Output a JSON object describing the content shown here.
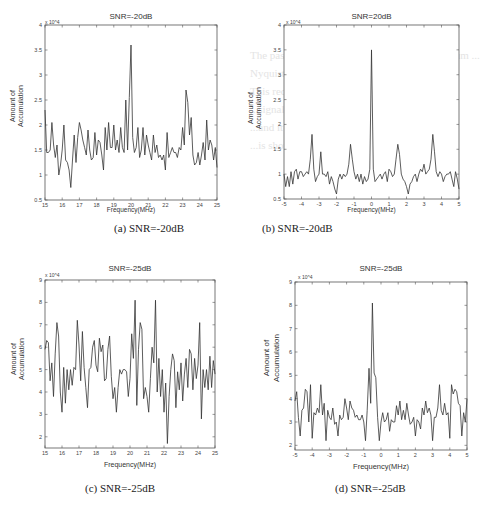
{
  "figure": {
    "captions": [
      "(a) SNR=-20dB",
      "(b) SNR=-20dB",
      "(c) SNR=-25dB",
      "(d) SNR=-25dB"
    ]
  },
  "chart_data": [
    {
      "type": "line",
      "panel": "a",
      "title": "SNR=-20dB",
      "caption": "(a) SNR=-20dB",
      "xlabel": "Frequency(MHz)",
      "ylabel": "Amount of Accumulation",
      "y_exponent": "x 10^4",
      "xlim": [
        15,
        25
      ],
      "ylim": [
        0.5,
        4
      ],
      "xticks": [
        15,
        16,
        17,
        18,
        19,
        20,
        21,
        22,
        23,
        24,
        25
      ],
      "yticks": [
        0.5,
        1,
        1.5,
        2,
        2.5,
        3,
        3.5,
        4
      ],
      "grid": false,
      "x": [
        15,
        15.1,
        15.2,
        15.3,
        15.4,
        15.5,
        15.6,
        15.7,
        15.8,
        15.9,
        16,
        16.1,
        16.2,
        16.3,
        16.4,
        16.5,
        16.6,
        16.7,
        16.8,
        16.9,
        17,
        17.1,
        17.2,
        17.3,
        17.4,
        17.5,
        17.6,
        17.7,
        17.8,
        17.9,
        18,
        18.1,
        18.2,
        18.3,
        18.4,
        18.5,
        18.6,
        18.7,
        18.8,
        18.9,
        19,
        19.1,
        19.2,
        19.3,
        19.4,
        19.5,
        19.6,
        19.7,
        19.8,
        19.9,
        20,
        20.1,
        20.2,
        20.3,
        20.4,
        20.5,
        20.6,
        20.7,
        20.8,
        20.9,
        21,
        21.1,
        21.2,
        21.3,
        21.4,
        21.5,
        21.6,
        21.7,
        21.8,
        21.9,
        22,
        22.1,
        22.2,
        22.3,
        22.4,
        22.5,
        22.6,
        22.7,
        22.8,
        22.9,
        23,
        23.1,
        23.2,
        23.3,
        23.4,
        23.5,
        23.6,
        23.7,
        23.8,
        23.9,
        24,
        24.1,
        24.2,
        24.3,
        24.4,
        24.5,
        24.6,
        24.7,
        24.8,
        24.9,
        25
      ],
      "values": [
        2.3,
        1.45,
        1.45,
        1.5,
        2.05,
        1.6,
        1.35,
        1.6,
        1.0,
        1.2,
        1.5,
        2.0,
        1.3,
        1.25,
        1.1,
        0.75,
        1.3,
        1.8,
        1.25,
        1.75,
        2.05,
        1.9,
        1.7,
        1.55,
        1.4,
        1.9,
        1.5,
        1.3,
        1.35,
        1.85,
        1.4,
        1.7,
        1.65,
        1.4,
        1.1,
        1.95,
        1.5,
        2.05,
        1.55,
        1.55,
        2.0,
        1.5,
        1.7,
        1.45,
        1.95,
        1.55,
        1.45,
        2.5,
        1.5,
        2.55,
        3.6,
        1.75,
        1.45,
        1.55,
        1.95,
        1.35,
        1.5,
        1.95,
        1.4,
        1.8,
        1.6,
        1.45,
        1.3,
        1.8,
        1.45,
        1.6,
        1.35,
        1.4,
        1.3,
        1.4,
        1.1,
        1.85,
        1.35,
        1.45,
        1.55,
        1.45,
        1.45,
        1.35,
        1.55,
        1.5,
        1.95,
        1.6,
        2.7,
        2.45,
        1.8,
        2.15,
        1.4,
        1.2,
        1.25,
        1.45,
        1.2,
        1.4,
        1.65,
        1.3,
        2.1,
        1.5,
        1.7,
        1.6,
        1.3,
        1.55,
        1.15
      ]
    },
    {
      "type": "line",
      "panel": "b",
      "title": "SNR=20dB",
      "caption": "(b) SNR=-20dB",
      "xlabel": "Frequency(MHz)",
      "ylabel": "Amount of Accumulation",
      "y_exponent": "x 10^4",
      "xlim": [
        -5,
        5
      ],
      "ylim": [
        0.5,
        4
      ],
      "xticks": [
        -5,
        -4,
        -3,
        -2,
        -1,
        0,
        1,
        2,
        3,
        4,
        5
      ],
      "yticks": [
        0.5,
        1,
        1.5,
        2,
        2.5,
        3,
        3.5,
        4
      ],
      "grid": false,
      "x": [
        -5,
        -4.9,
        -4.8,
        -4.7,
        -4.6,
        -4.5,
        -4.4,
        -4.3,
        -4.2,
        -4.1,
        -4,
        -3.9,
        -3.8,
        -3.7,
        -3.6,
        -3.5,
        -3.4,
        -3.3,
        -3.2,
        -3.1,
        -3,
        -2.9,
        -2.8,
        -2.7,
        -2.6,
        -2.5,
        -2.4,
        -2.3,
        -2.2,
        -2.1,
        -2,
        -1.9,
        -1.8,
        -1.7,
        -1.6,
        -1.5,
        -1.4,
        -1.3,
        -1.2,
        -1.1,
        -1,
        -0.9,
        -0.8,
        -0.7,
        -0.6,
        -0.5,
        -0.4,
        -0.3,
        -0.2,
        -0.1,
        0,
        0.1,
        0.2,
        0.3,
        0.4,
        0.5,
        0.6,
        0.7,
        0.8,
        0.9,
        1,
        1.1,
        1.2,
        1.3,
        1.4,
        1.5,
        1.6,
        1.7,
        1.8,
        1.9,
        2,
        2.1,
        2.2,
        2.3,
        2.4,
        2.5,
        2.6,
        2.7,
        2.8,
        2.9,
        3,
        3.1,
        3.2,
        3.3,
        3.4,
        3.5,
        3.6,
        3.7,
        3.8,
        3.9,
        4,
        4.1,
        4.2,
        4.3,
        4.4,
        4.5,
        4.6,
        4.7,
        4.8,
        4.9,
        5
      ],
      "values": [
        1.0,
        0.75,
        0.95,
        0.75,
        1.05,
        0.8,
        1.05,
        1.1,
        0.9,
        1.05,
        1.05,
        0.95,
        1.0,
        1.05,
        1.0,
        1.3,
        1.8,
        1.1,
        0.85,
        0.95,
        1.0,
        1.45,
        1.0,
        1.0,
        0.95,
        1.05,
        0.8,
        0.95,
        0.85,
        0.7,
        0.6,
        0.9,
        1.0,
        0.9,
        1.0,
        0.95,
        1.0,
        1.2,
        1.6,
        1.3,
        1.05,
        0.9,
        1.0,
        0.85,
        1.0,
        0.8,
        0.95,
        0.85,
        0.9,
        1.1,
        3.5,
        1.1,
        0.85,
        0.9,
        0.95,
        1.0,
        0.9,
        1.0,
        1.05,
        0.85,
        1.1,
        1.05,
        0.95,
        1.0,
        1.3,
        1.6,
        1.4,
        1.0,
        0.9,
        0.85,
        0.75,
        0.6,
        0.8,
        0.85,
        0.95,
        1.0,
        0.85,
        1.0,
        1.1,
        1.05,
        1.2,
        1.0,
        1.05,
        1.1,
        1.3,
        1.8,
        1.45,
        1.05,
        0.95,
        1.05,
        1.0,
        0.85,
        0.95,
        1.0,
        1.0,
        1.05,
        0.9,
        0.75,
        1.05,
        0.9,
        0.7
      ]
    },
    {
      "type": "line",
      "panel": "c",
      "title": "SNR=-25dB",
      "caption": "(c) SNR=-25dB",
      "xlabel": "Frequency(MHz)",
      "ylabel": "Amount of Accumulation",
      "y_exponent": "x 10^4",
      "xlim": [
        15,
        25
      ],
      "ylim": [
        1.5,
        9
      ],
      "xticks": [
        15,
        16,
        17,
        18,
        19,
        20,
        21,
        22,
        23,
        24,
        25
      ],
      "yticks": [
        2,
        3,
        4,
        5,
        6,
        7,
        8,
        9
      ],
      "grid": false,
      "x": [
        15,
        15.1,
        15.2,
        15.3,
        15.4,
        15.5,
        15.6,
        15.7,
        15.8,
        15.9,
        16,
        16.1,
        16.2,
        16.3,
        16.4,
        16.5,
        16.6,
        16.7,
        16.8,
        16.9,
        17,
        17.1,
        17.2,
        17.3,
        17.4,
        17.5,
        17.6,
        17.7,
        17.8,
        17.9,
        18,
        18.1,
        18.2,
        18.3,
        18.4,
        18.5,
        18.6,
        18.7,
        18.8,
        18.9,
        19,
        19.1,
        19.2,
        19.3,
        19.4,
        19.5,
        19.6,
        19.7,
        19.8,
        19.9,
        20,
        20.1,
        20.2,
        20.3,
        20.4,
        20.5,
        20.6,
        20.7,
        20.8,
        20.9,
        21,
        21.1,
        21.2,
        21.3,
        21.4,
        21.5,
        21.6,
        21.7,
        21.8,
        21.9,
        22,
        22.1,
        22.2,
        22.3,
        22.4,
        22.5,
        22.6,
        22.7,
        22.8,
        22.9,
        23,
        23.1,
        23.2,
        23.3,
        23.4,
        23.5,
        23.6,
        23.7,
        23.8,
        23.9,
        24,
        24.1,
        24.2,
        24.3,
        24.4,
        24.5,
        24.6,
        24.7,
        24.8,
        24.9,
        25
      ],
      "values": [
        5.9,
        6.3,
        6.2,
        4.5,
        5.3,
        3.8,
        5.7,
        7.1,
        6.5,
        4.0,
        3.1,
        5.1,
        3.5,
        5.0,
        4.1,
        5.0,
        4.3,
        5.1,
        5.0,
        7.2,
        6.1,
        4.5,
        6.7,
        5.1,
        4.2,
        3.3,
        5.0,
        5.1,
        6.0,
        6.3,
        5.2,
        4.9,
        6.4,
        5.8,
        6.1,
        4.5,
        4.6,
        5.9,
        6.5,
        4.7,
        3.7,
        4.2,
        3.1,
        4.2,
        5.0,
        4.8,
        5.0,
        5.0,
        4.9,
        3.8,
        4.6,
        6.6,
        5.5,
        8.1,
        3.4,
        5.9,
        7.1,
        6.8,
        3.7,
        4.2,
        3.8,
        3.1,
        4.6,
        6.0,
        5.3,
        8.1,
        4.0,
        5.5,
        3.8,
        5.0,
        3.1,
        4.4,
        1.7,
        3.8,
        5.0,
        5.7,
        5.4,
        3.3,
        4.9,
        4.1,
        5.3,
        3.6,
        4.8,
        5.5,
        4.2,
        5.9,
        5.7,
        4.1,
        5.5,
        4.6,
        5.2,
        7.1,
        2.8,
        5.0,
        4.2,
        5.0,
        4.1,
        5.6,
        4.2,
        5.4,
        4.8
      ]
    },
    {
      "type": "line",
      "panel": "d",
      "title": "SNR=-25dB",
      "caption": "(d) SNR=-25dB",
      "xlabel": "Frequency(MHz)",
      "ylabel": "Amount of Accumulation",
      "y_exponent": "x 10^4",
      "xlim": [
        -5,
        5
      ],
      "ylim": [
        1.8,
        9
      ],
      "xticks": [
        -5,
        -4,
        -3,
        -2,
        -1,
        0,
        1,
        2,
        3,
        4,
        5
      ],
      "yticks": [
        2,
        3,
        4,
        5,
        6,
        7,
        8,
        9
      ],
      "grid": false,
      "x": [
        -5,
        -4.9,
        -4.8,
        -4.7,
        -4.6,
        -4.5,
        -4.4,
        -4.3,
        -4.2,
        -4.1,
        -4,
        -3.9,
        -3.8,
        -3.7,
        -3.6,
        -3.5,
        -3.4,
        -3.3,
        -3.2,
        -3.1,
        -3,
        -2.9,
        -2.8,
        -2.7,
        -2.6,
        -2.5,
        -2.4,
        -2.3,
        -2.2,
        -2.1,
        -2,
        -1.9,
        -1.8,
        -1.7,
        -1.6,
        -1.5,
        -1.4,
        -1.3,
        -1.2,
        -1.1,
        -1,
        -0.9,
        -0.8,
        -0.7,
        -0.6,
        -0.5,
        -0.4,
        -0.3,
        -0.2,
        -0.1,
        0,
        0.1,
        0.2,
        0.3,
        0.4,
        0.5,
        0.6,
        0.7,
        0.8,
        0.9,
        1,
        1.1,
        1.2,
        1.3,
        1.4,
        1.5,
        1.6,
        1.7,
        1.8,
        1.9,
        2,
        2.1,
        2.2,
        2.3,
        2.4,
        2.5,
        2.6,
        2.7,
        2.8,
        2.9,
        3,
        3.1,
        3.2,
        3.3,
        3.4,
        3.5,
        3.6,
        3.7,
        3.8,
        3.9,
        4,
        4.1,
        4.2,
        4.3,
        4.4,
        4.5,
        4.6,
        4.7,
        4.8,
        4.9,
        5
      ],
      "values": [
        3.9,
        4.3,
        3.2,
        2.4,
        3.5,
        3.6,
        4.4,
        4.3,
        3.0,
        4.6,
        2.3,
        3.4,
        3.3,
        3.6,
        3.4,
        4.6,
        3.3,
        3.8,
        2.2,
        3.5,
        3.2,
        3.1,
        3.6,
        2.9,
        3.0,
        2.4,
        3.3,
        3.1,
        3.2,
        4.0,
        3.6,
        3.1,
        3.9,
        3.6,
        3.5,
        3.2,
        3.3,
        3.1,
        3.1,
        3.3,
        3.0,
        2.2,
        3.5,
        5.3,
        3.8,
        8.1,
        5.1,
        4.9,
        3.2,
        2.2,
        3.0,
        3.4,
        3.0,
        3.1,
        3.4,
        2.6,
        3.1,
        3.0,
        3.0,
        3.7,
        3.3,
        3.9,
        3.1,
        3.5,
        3.1,
        3.8,
        3.3,
        2.9,
        3.0,
        3.2,
        2.4,
        3.1,
        3.0,
        2.7,
        3.6,
        3.3,
        3.9,
        3.4,
        3.6,
        3.3,
        2.2,
        3.2,
        3.2,
        3.6,
        4.6,
        3.5,
        3.3,
        3.8,
        3.3,
        3.4,
        2.3,
        4.6,
        4.2,
        4.4,
        4.3,
        3.8,
        3.7,
        2.4,
        3.4,
        3.0,
        4.0
      ]
    }
  ]
}
